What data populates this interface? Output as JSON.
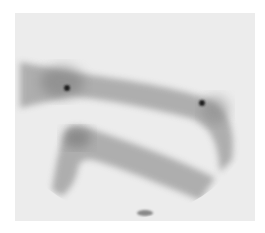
{
  "image": {
    "description": "Gamma camera scintigraphy scan showing two curved bands of tracer uptake with two focal hot spots",
    "colors": {
      "background": "#ffffff",
      "field": "#ececec",
      "uptake": "#6a6a6a",
      "hotspot": "#1e1e1e"
    },
    "hotspots": [
      {
        "cx": 67,
        "cy": 88
      },
      {
        "cx": 202,
        "cy": 103
      }
    ]
  }
}
